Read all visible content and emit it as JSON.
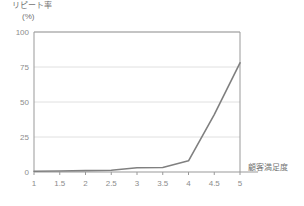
{
  "chart_data": {
    "type": "line",
    "title": "",
    "subtitle": "",
    "ylabel": "リピート率",
    "yunit": "(%)",
    "xlabel": "顧客満足度",
    "x": [
      1,
      1.5,
      2,
      2.5,
      3,
      3.5,
      4,
      4.5,
      5
    ],
    "xtick_labels": [
      "1",
      "1.5",
      "2",
      "2.5",
      "3",
      "3.5",
      "4",
      "4.5",
      "5"
    ],
    "ytick_labels": [
      "0",
      "25",
      "50",
      "75",
      "100"
    ],
    "ytick_values": [
      0,
      25,
      50,
      75,
      100
    ],
    "ylim": [
      0,
      100
    ],
    "xlim": [
      1,
      5
    ],
    "grid": "horizontal",
    "legend": "none",
    "series": [
      {
        "name": "リピート率",
        "color": "#808080",
        "values": [
          0.5,
          0.7,
          1.0,
          1.3,
          3.0,
          3.2,
          8.0,
          41.0,
          78.0
        ]
      }
    ],
    "colors": {
      "line": "#808080",
      "axis": "#999999",
      "grid": "#e0e0e0",
      "text": "#808080",
      "background": "#ffffff"
    }
  },
  "axes": {
    "y_title": "リピート率",
    "y_unit": "(%)",
    "x_title": "顧客満足度"
  }
}
